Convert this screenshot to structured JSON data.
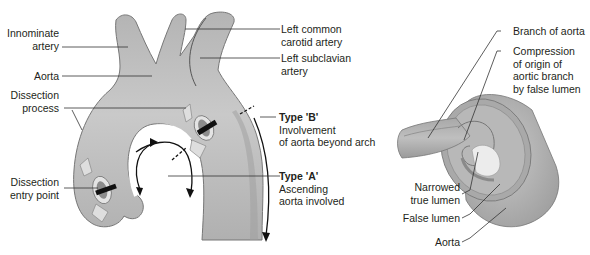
{
  "figure": {
    "left_diagram": {
      "name": "aortic-dissection-types",
      "labels": {
        "innominate": [
          "Innominate",
          "artery"
        ],
        "aorta": "Aorta",
        "dissection_process": [
          "Dissection",
          "process"
        ],
        "dissection_entry": [
          "Dissection",
          "entry point"
        ],
        "left_common_carotid": [
          "Left common",
          "carotid artery"
        ],
        "left_subclavian": [
          "Left subclavian",
          "artery"
        ],
        "type_b": {
          "title": "Type 'B'",
          "lines": [
            "Involvement",
            "of aorta beyond arch"
          ]
        },
        "type_a": {
          "title": "Type 'A'",
          "lines": [
            "Ascending",
            "aorta involved"
          ]
        }
      }
    },
    "right_diagram": {
      "name": "branch-compression-detail",
      "labels": {
        "branch": "Branch of aorta",
        "compression": [
          "Compression",
          "of origin of",
          "aortic branch",
          "by false lumen"
        ],
        "narrowed": [
          "Narrowed",
          "true lumen"
        ],
        "false_lumen": "False lumen",
        "aorta": "Aorta"
      }
    },
    "colors": {
      "vessel": "#a7a7a7",
      "vessel_light": "#cfcfcf",
      "vessel_dark": "#8a8a8a",
      "outline": "#6e6e6e",
      "text": "#231f20",
      "lumen_pale": "#e6e6e6"
    }
  }
}
